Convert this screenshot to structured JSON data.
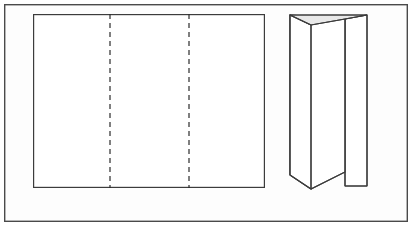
{
  "figure": {
    "background_color": "#ffffff",
    "frame": {
      "name": "outer-frame",
      "x": 4,
      "y": 4,
      "width": 404,
      "height": 218,
      "stroke_color": "#4a4a4a",
      "stroke_width": 1.4,
      "fill_color": "#fdfdfd"
    },
    "flat_sheet": {
      "label": "unfolded-flat-sheet",
      "x": 33,
      "y": 14,
      "width": 232,
      "height": 174,
      "stroke_color": "#3c3c3c",
      "stroke_width": 1.2,
      "fill_color": "#ffffff",
      "panel_count": 3,
      "fold_lines": [
        {
          "label": "fold-line-left",
          "x": 110,
          "y_top": 14,
          "y_bottom": 188,
          "style": "dashed",
          "dash_pattern": "5,4",
          "stroke_color": "#2b2b2b",
          "stroke_width": 1.2
        },
        {
          "label": "fold-line-right",
          "x": 189,
          "y_top": 14,
          "y_bottom": 188,
          "style": "dashed",
          "dash_pattern": "5,4",
          "stroke_color": "#2b2b2b",
          "stroke_width": 1.2
        }
      ]
    },
    "folded_view": {
      "label": "folded-brochure-perspective",
      "stroke_color": "#3c3c3c",
      "stroke_width": 1.2,
      "top_shade_color": "#e9e9e9",
      "face_color": "#ffffff",
      "outline_points": "290,15 367,15 367,186 345,186 345,172 311,189 290,175",
      "back_panel": {
        "label": "back-panel-right",
        "points": "345,19 367,15 367,186 345,186"
      },
      "front_panel": {
        "label": "front-panel-large",
        "points": "290,15 345,19 345,172 311,189 290,175"
      },
      "left_panel": {
        "label": "left-panel-folded-in",
        "points": "290,15 311,25 311,189 290,175"
      },
      "top_shaded_triangle": {
        "label": "top-edge-shade",
        "points": "290,15 367,15 345,19 311,25"
      },
      "spine_fold": {
        "label": "spine-fold-edge",
        "x1": 311,
        "y1": 25,
        "x2": 311,
        "y2": 189
      },
      "inner_fold": {
        "label": "inner-fold-edge",
        "x1": 345,
        "y1": 19,
        "x2": 345,
        "y2": 186
      }
    }
  }
}
